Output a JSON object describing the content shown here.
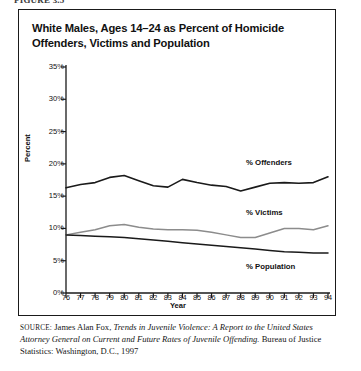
{
  "figure": {
    "caption_top": "FIGURE 3.5",
    "title": "White Males, Ages 14–24 as Percent of Homicide Offenders, Victims and Population"
  },
  "source": {
    "keyword": "source:",
    "author": "James Alan Fox,",
    "work_italic": "Trends in Juvenile Violence: A Report to the United States Attorney General on Current and Future Rates of Juvenile Offending.",
    "publisher": "Bureau of Justice Statistics: Washington, D.C., 1997"
  },
  "chart_data": {
    "type": "line",
    "title": "White Males, Ages 14–24 as Percent of Homicide Offenders, Victims and Population",
    "xlabel": "Year",
    "ylabel": "Percent",
    "xlim": [
      76,
      94
    ],
    "ylim": [
      0,
      35
    ],
    "ytick_labels": [
      "0%",
      "5%",
      "10%",
      "15%",
      "20%",
      "25%",
      "30%",
      "35%"
    ],
    "ytick_values": [
      0,
      5,
      10,
      15,
      20,
      25,
      30,
      35
    ],
    "grid": false,
    "legend_position": "inline-right",
    "categories": [
      76,
      77,
      78,
      79,
      80,
      81,
      82,
      83,
      84,
      85,
      86,
      87,
      88,
      89,
      90,
      91,
      92,
      93,
      94
    ],
    "xtick_labels": [
      "76",
      "77",
      "78",
      "79",
      "80",
      "81",
      "82",
      "83",
      "84",
      "85",
      "86",
      "87",
      "88",
      "89",
      "90",
      "91",
      "92",
      "93",
      "94"
    ],
    "series": [
      {
        "name": "% Offenders",
        "label": "% Offenders",
        "color": "#1a1a1a",
        "width": 1.6,
        "values": [
          16.3,
          16.8,
          17.1,
          17.9,
          18.2,
          17.4,
          16.6,
          16.4,
          17.6,
          17.1,
          16.7,
          16.5,
          15.8,
          16.4,
          17.0,
          17.1,
          17.0,
          17.1,
          18.0
        ]
      },
      {
        "name": "% Victims",
        "label": "% Victims",
        "color": "#8c8c8c",
        "width": 1.5,
        "values": [
          9.0,
          9.4,
          9.8,
          10.4,
          10.6,
          10.2,
          9.9,
          9.8,
          9.8,
          9.7,
          9.4,
          9.0,
          8.6,
          8.6,
          9.3,
          10.0,
          10.0,
          9.8,
          10.4
        ]
      },
      {
        "name": "% Population",
        "label": "% Population",
        "color": "#1a1a1a",
        "width": 1.5,
        "values": [
          9.0,
          8.9,
          8.8,
          8.7,
          8.6,
          8.4,
          8.2,
          8.0,
          7.8,
          7.6,
          7.4,
          7.2,
          7.0,
          6.8,
          6.6,
          6.4,
          6.3,
          6.2,
          6.2
        ]
      }
    ]
  }
}
